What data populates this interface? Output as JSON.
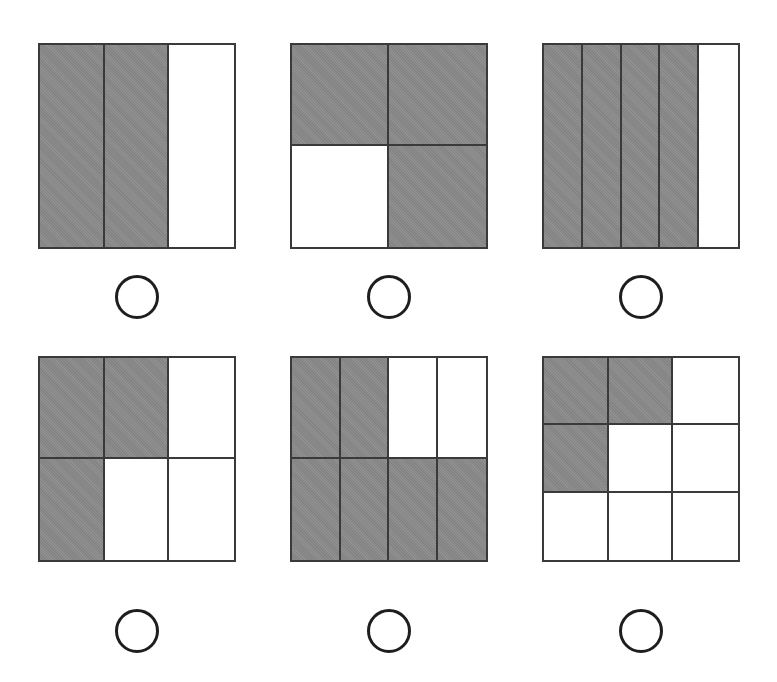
{
  "colors": {
    "shaded": "#8a8a8a",
    "border": "#3a3a3a",
    "radio": "#1e1e1e",
    "background": "#ffffff"
  },
  "figures": [
    {
      "id": "fig-1",
      "cols": 3,
      "rows": 1,
      "shaded": [
        1,
        1,
        0
      ],
      "left": 38,
      "top": 43
    },
    {
      "id": "fig-2",
      "cols": 2,
      "rows": 2,
      "shaded": [
        1,
        1,
        0,
        1
      ],
      "left": 290,
      "top": 43
    },
    {
      "id": "fig-3",
      "cols": 5,
      "rows": 1,
      "shaded": [
        1,
        1,
        1,
        1,
        0
      ],
      "left": 542,
      "top": 43
    },
    {
      "id": "fig-4",
      "cols": 3,
      "rows": 2,
      "shaded": [
        1,
        1,
        0,
        1,
        0,
        0
      ],
      "left": 38,
      "top": 356
    },
    {
      "id": "fig-5",
      "cols": 4,
      "rows": 2,
      "shaded": [
        1,
        1,
        0,
        0,
        1,
        1,
        1,
        1
      ],
      "left": 290,
      "top": 356
    },
    {
      "id": "fig-6",
      "cols": 3,
      "rows": 3,
      "shaded": [
        1,
        1,
        0,
        1,
        0,
        0,
        0,
        0,
        0
      ],
      "left": 542,
      "top": 356
    }
  ],
  "options": [
    {
      "id": "option-1",
      "cx": 137,
      "cy": 297
    },
    {
      "id": "option-2",
      "cx": 389,
      "cy": 297
    },
    {
      "id": "option-3",
      "cx": 641,
      "cy": 297
    },
    {
      "id": "option-4",
      "cx": 137,
      "cy": 631
    },
    {
      "id": "option-5",
      "cx": 389,
      "cy": 631
    },
    {
      "id": "option-6",
      "cx": 641,
      "cy": 631
    }
  ]
}
